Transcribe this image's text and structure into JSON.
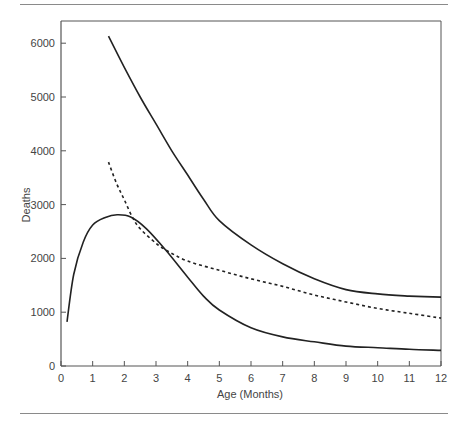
{
  "chart_data": {
    "type": "line",
    "title": "",
    "xlabel": "Age (Months)",
    "ylabel": "Deaths",
    "xlim": [
      0,
      12
    ],
    "ylim": [
      0,
      6400
    ],
    "x_ticks": [
      0,
      1,
      2,
      3,
      4,
      5,
      6,
      7,
      8,
      9,
      10,
      11,
      12
    ],
    "y_ticks": [
      0,
      1000,
      2000,
      3000,
      4000,
      5000,
      6000
    ],
    "grid": false,
    "legend": null,
    "series": [
      {
        "name": "Upper solid curve",
        "style": "solid",
        "x": [
          1.5,
          2,
          2.5,
          3,
          3.5,
          4,
          4.5,
          5,
          6,
          7,
          8,
          9,
          10,
          11,
          12
        ],
        "y": [
          6130,
          5550,
          5000,
          4500,
          4000,
          3550,
          3100,
          2700,
          2250,
          1900,
          1620,
          1420,
          1340,
          1300,
          1280
        ]
      },
      {
        "name": "Dashed curve",
        "style": "dashed",
        "x": [
          1.5,
          1.75,
          2,
          2.25,
          2.5,
          3,
          3.3,
          4,
          5,
          6,
          7,
          8,
          9,
          10,
          11,
          12
        ],
        "y": [
          3790,
          3400,
          3090,
          2770,
          2550,
          2280,
          2160,
          1950,
          1780,
          1620,
          1480,
          1320,
          1190,
          1070,
          980,
          890
        ]
      },
      {
        "name": "Lower solid curve",
        "style": "solid",
        "x": [
          0.19,
          0.4,
          0.7,
          1,
          1.4,
          1.77,
          2.2,
          2.7,
          3.3,
          4,
          4.5,
          5,
          6,
          7,
          8,
          9,
          10,
          11,
          12
        ],
        "y": [
          820,
          1700,
          2300,
          2620,
          2760,
          2810,
          2770,
          2550,
          2160,
          1650,
          1300,
          1040,
          710,
          540,
          450,
          370,
          340,
          310,
          290
        ]
      }
    ]
  },
  "labels": {
    "xlabel": "Age (Months)",
    "ylabel": "Deaths",
    "x_ticks": [
      "0",
      "1",
      "2",
      "3",
      "4",
      "5",
      "6",
      "7",
      "8",
      "9",
      "10",
      "11",
      "12"
    ],
    "y_ticks": [
      "0",
      "1000",
      "2000",
      "3000",
      "4000",
      "5000",
      "6000"
    ]
  },
  "colors": {
    "line": "#222222",
    "axis": "#555555",
    "rule": "#8a8a8a"
  }
}
